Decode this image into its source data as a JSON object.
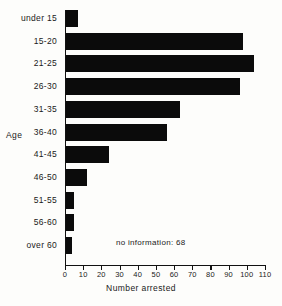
{
  "chart_data": {
    "type": "bar",
    "orientation": "horizontal",
    "title": "",
    "xlabel": "Number arrested",
    "ylabel": "Age",
    "categories": [
      "under 15",
      "15-20",
      "21-25",
      "26-30",
      "31-35",
      "36-40",
      "41-45",
      "46-50",
      "51-55",
      "56-60",
      "over 60"
    ],
    "values": [
      7,
      98,
      104,
      96,
      63,
      56,
      24,
      12,
      5,
      5,
      4
    ],
    "xlim": [
      0,
      110
    ],
    "xticks": [
      0,
      10,
      20,
      30,
      40,
      50,
      60,
      70,
      80,
      90,
      100,
      110
    ],
    "xtick_labels": [
      "0",
      "10",
      "20",
      "30",
      "40",
      "50",
      "60",
      "70",
      "80",
      "90",
      "100",
      "110"
    ],
    "grid": false,
    "legend": null,
    "annotations": [
      {
        "text": "no information: 68",
        "x": 25,
        "y": "56-60"
      }
    ],
    "bar_color": "#0b0b0b",
    "background_color": "#fdfdfb",
    "axis_color": "#111111"
  }
}
